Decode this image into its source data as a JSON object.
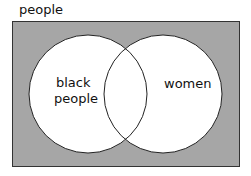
{
  "diagram": {
    "type": "venn",
    "universe_label": "people",
    "sets": [
      {
        "label_line1": "black",
        "label_line2": "people"
      },
      {
        "label": "women"
      }
    ],
    "colors": {
      "background": "#a6a6a6",
      "circle_fill": "#ffffff",
      "stroke": "#222222"
    }
  }
}
